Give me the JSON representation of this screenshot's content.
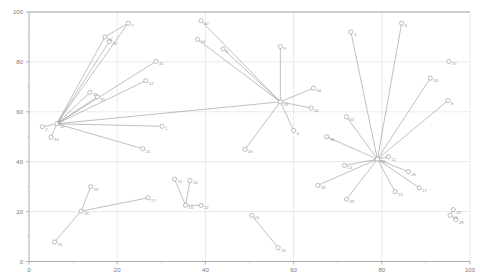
{
  "chart_data": {
    "type": "scatter",
    "title": "",
    "subtitle": "",
    "xlabel": "",
    "ylabel": "",
    "xlim": [
      0,
      100
    ],
    "ylim": [
      0,
      100
    ],
    "xticks": [
      0,
      20,
      40,
      60,
      80,
      100
    ],
    "yticks": [
      0,
      20,
      40,
      60,
      80,
      100
    ],
    "xtick_labels": [
      "0",
      "20",
      "40",
      "60",
      "80",
      "100"
    ],
    "ytick_labels": [
      "0",
      "20",
      "40",
      "60",
      "80",
      "100"
    ],
    "grid": true,
    "legend": "none",
    "marker": "open-circle",
    "edge_color": "#8c8c8c",
    "node_color": "#8a8a8a",
    "grid_color": "#c9d6e4",
    "axis_color": "#8a8a8a",
    "points": [
      {
        "id": "7",
        "x": 22.5,
        "y": 95.5
      },
      {
        "id": "44",
        "x": 17.2,
        "y": 90.0
      },
      {
        "id": "33",
        "x": 18.2,
        "y": 88.2
      },
      {
        "id": "41",
        "x": 28.8,
        "y": 80.2
      },
      {
        "id": "32",
        "x": 26.5,
        "y": 72.5
      },
      {
        "id": "35",
        "x": 13.8,
        "y": 67.8
      },
      {
        "id": "31",
        "x": 15.5,
        "y": 66.0
      },
      {
        "id": "10",
        "x": 6.3,
        "y": 55.2
      },
      {
        "id": "2",
        "x": 3.0,
        "y": 54.0
      },
      {
        "id": "34",
        "x": 5.0,
        "y": 49.8
      },
      {
        "id": "1",
        "x": 30.2,
        "y": 54.2
      },
      {
        "id": "21",
        "x": 25.8,
        "y": 45.2
      },
      {
        "id": "40",
        "x": 39.0,
        "y": 96.5
      },
      {
        "id": "14",
        "x": 38.2,
        "y": 89.0
      },
      {
        "id": "5",
        "x": 44.0,
        "y": 85.2
      },
      {
        "id": "9",
        "x": 57.0,
        "y": 86.2
      },
      {
        "id": "18",
        "x": 57.0,
        "y": 64.0
      },
      {
        "id": "34b",
        "x": 64.5,
        "y": 69.5
      },
      {
        "id": "42",
        "x": 64.0,
        "y": 61.5
      },
      {
        "id": "4",
        "x": 60.0,
        "y": 52.5
      },
      {
        "id": "45",
        "x": 49.0,
        "y": 45.0
      },
      {
        "id": "3",
        "x": 73.0,
        "y": 92.0
      },
      {
        "id": "6",
        "x": 84.5,
        "y": 95.5
      },
      {
        "id": "50",
        "x": 72.0,
        "y": 58.0
      },
      {
        "id": "30",
        "x": 91.0,
        "y": 73.5
      },
      {
        "id": "8",
        "x": 95.0,
        "y": 64.5
      },
      {
        "id": "39",
        "x": 79.0,
        "y": 41.0
      },
      {
        "id": "11",
        "x": 81.5,
        "y": 42.0
      },
      {
        "id": "36",
        "x": 67.5,
        "y": 50.0
      },
      {
        "id": "12",
        "x": 71.5,
        "y": 38.5
      },
      {
        "id": "38",
        "x": 65.5,
        "y": 30.5
      },
      {
        "id": "46",
        "x": 86.0,
        "y": 36.0
      },
      {
        "id": "17",
        "x": 88.5,
        "y": 29.5
      },
      {
        "id": "13",
        "x": 83.0,
        "y": 28.0
      },
      {
        "id": "49",
        "x": 72.0,
        "y": 25.0
      },
      {
        "id": "23",
        "x": 14.0,
        "y": 30.0
      },
      {
        "id": "19",
        "x": 11.8,
        "y": 20.2
      },
      {
        "id": "27",
        "x": 27.0,
        "y": 25.5
      },
      {
        "id": "25",
        "x": 5.8,
        "y": 7.8
      },
      {
        "id": "15",
        "x": 33.0,
        "y": 33.0
      },
      {
        "id": "43",
        "x": 36.5,
        "y": 32.5
      },
      {
        "id": "16",
        "x": 35.5,
        "y": 22.5
      },
      {
        "id": "22",
        "x": 39.0,
        "y": 22.5
      },
      {
        "id": "20",
        "x": 50.5,
        "y": 18.5
      },
      {
        "id": "26",
        "x": 56.5,
        "y": 5.5
      },
      {
        "id": "29",
        "x": 96.2,
        "y": 20.8
      },
      {
        "id": "24",
        "x": 95.5,
        "y": 18.5
      },
      {
        "id": "28",
        "x": 96.8,
        "y": 16.8
      },
      {
        "id": "47",
        "x": 95.2,
        "y": 80.2
      }
    ],
    "edges": [
      [
        "10",
        "7"
      ],
      [
        "10",
        "44"
      ],
      [
        "10",
        "33"
      ],
      [
        "10",
        "41"
      ],
      [
        "10",
        "32"
      ],
      [
        "10",
        "35"
      ],
      [
        "10",
        "31"
      ],
      [
        "10",
        "2"
      ],
      [
        "10",
        "34"
      ],
      [
        "10",
        "1"
      ],
      [
        "10",
        "21"
      ],
      [
        "44",
        "7"
      ],
      [
        "18",
        "40"
      ],
      [
        "18",
        "14"
      ],
      [
        "18",
        "5"
      ],
      [
        "18",
        "9"
      ],
      [
        "18",
        "34b"
      ],
      [
        "18",
        "42"
      ],
      [
        "18",
        "4"
      ],
      [
        "18",
        "45"
      ],
      [
        "18",
        "10"
      ],
      [
        "39",
        "3"
      ],
      [
        "39",
        "6"
      ],
      [
        "39",
        "50"
      ],
      [
        "39",
        "30"
      ],
      [
        "39",
        "8"
      ],
      [
        "39",
        "11"
      ],
      [
        "39",
        "36"
      ],
      [
        "39",
        "12"
      ],
      [
        "39",
        "38"
      ],
      [
        "39",
        "46"
      ],
      [
        "39",
        "17"
      ],
      [
        "39",
        "13"
      ],
      [
        "39",
        "49"
      ],
      [
        "19",
        "23"
      ],
      [
        "19",
        "27"
      ],
      [
        "19",
        "25"
      ],
      [
        "16",
        "15"
      ],
      [
        "16",
        "43"
      ],
      [
        "16",
        "22"
      ],
      [
        "20",
        "26"
      ],
      [
        "29",
        "24"
      ],
      [
        "24",
        "28"
      ]
    ]
  },
  "axes": {
    "x_axis_name": "x-axis",
    "y_axis_name": "y-axis"
  }
}
